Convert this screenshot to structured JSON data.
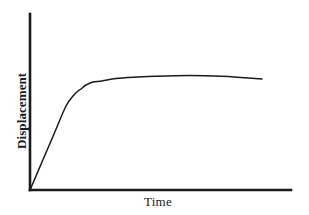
{
  "figure": {
    "width": 309,
    "height": 215,
    "background_color": "#ffffff",
    "ink_color": "#1b1b1b"
  },
  "axes": {
    "y_axis_label": "Displacement",
    "x_axis_label": "Time",
    "origin_px": [
      30,
      190
    ],
    "y_axis_top_px": [
      30,
      14
    ],
    "x_axis_right_px": [
      291,
      190
    ],
    "axis_line_width_px": 2.6,
    "axis_color": "#1b1b1b"
  },
  "chart_data": {
    "type": "line",
    "title": "",
    "subtitle": "",
    "xlabel": "Time",
    "ylabel": "Displacement",
    "xlim": [
      0,
      1
    ],
    "ylim": [
      0,
      1
    ],
    "grid": false,
    "legend": null,
    "axis_ticks": {
      "x": [],
      "y": []
    },
    "annotations": [],
    "series": [
      {
        "name": "creep-curve",
        "color": "#1b1b1b",
        "line_width_px": 1.5,
        "x": [
          0.0,
          0.05,
          0.1,
          0.15,
          0.18,
          0.2,
          0.21,
          0.23,
          0.26,
          0.3,
          0.36,
          0.44,
          0.54,
          0.62,
          0.68,
          0.75,
          0.82,
          0.89,
          1.0
        ],
        "y": [
          0.0,
          0.16,
          0.31,
          0.47,
          0.53,
          0.56,
          0.58,
          0.6,
          0.615,
          0.625,
          0.64,
          0.652,
          0.66,
          0.664,
          0.666,
          0.665,
          0.662,
          0.657,
          0.648
        ],
        "pixel_points": [
          [
            30,
            190
          ],
          [
            42,
            162
          ],
          [
            54,
            134
          ],
          [
            66,
            106
          ],
          [
            73,
            96
          ],
          [
            78,
            91
          ],
          [
            81,
            89
          ],
          [
            86,
            85
          ],
          [
            93,
            82
          ],
          [
            102,
            81
          ],
          [
            116,
            78.5
          ],
          [
            134,
            77.2
          ],
          [
            157,
            76.3
          ],
          [
            175,
            75.8
          ],
          [
            189,
            75.6
          ],
          [
            205,
            75.8
          ],
          [
            221,
            76.3
          ],
          [
            237,
            77.2
          ],
          [
            262,
            79
          ]
        ]
      }
    ],
    "description": {
      "phase_1": "linear rise from origin",
      "phase_2": "knee / transition",
      "phase_3": "plateau with slight peak then gentle decline"
    }
  }
}
